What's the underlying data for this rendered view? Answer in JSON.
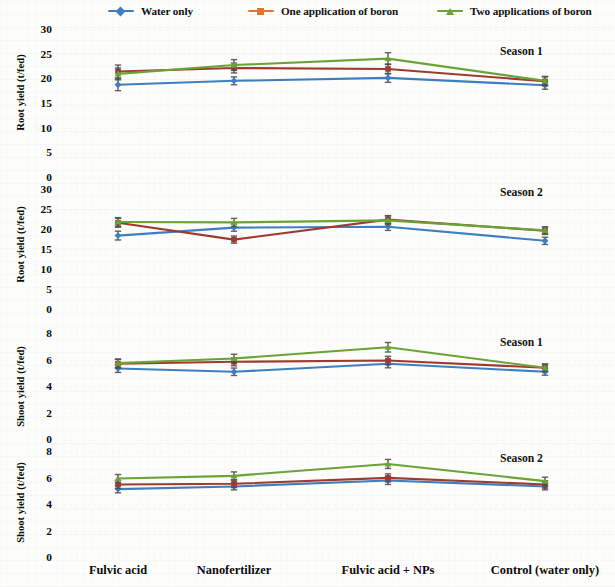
{
  "legend": {
    "items": [
      {
        "label": "Water only",
        "color": "#3d7fc1",
        "marker": "diamond"
      },
      {
        "label": "One application of boron",
        "color": "#e2762c",
        "marker": "square"
      },
      {
        "label": "Two applications of boron",
        "color": "#6aa338",
        "marker": "triangle"
      }
    ]
  },
  "chart_data": {
    "type": "line",
    "title": "",
    "xlabel": "",
    "grid": false,
    "legend_position": "top",
    "categories": [
      "Fulvic acid",
      "Nanofertilizer",
      "Fulvic acid + NPs",
      "Control (water only)"
    ],
    "panels": [
      {
        "id": "root-yield-season-1",
        "season": "Season 1",
        "ylabel": "Root yield (t/fed)",
        "yticks": [
          30,
          25,
          20,
          15,
          10,
          5,
          0
        ],
        "ylim": [
          0,
          30
        ],
        "series": [
          {
            "name": "Water only",
            "color": "#3d7fc1",
            "marker": "diamond",
            "values": [
              18.9,
              19.7,
              20.3,
              18.8
            ],
            "errors": [
              1.2,
              0.8,
              0.9,
              0.8
            ]
          },
          {
            "name": "One application of boron",
            "color": "#a03a2e",
            "marker": "square",
            "values": [
              21.6,
              22.3,
              22.1,
              19.6
            ],
            "errors": [
              1.3,
              1.0,
              1.0,
              0.9
            ]
          },
          {
            "name": "Two applications of boron",
            "color": "#6aa338",
            "marker": "triangle",
            "values": [
              21.1,
              22.9,
              24.2,
              19.7
            ],
            "errors": [
              1.2,
              1.1,
              1.2,
              0.9
            ]
          }
        ]
      },
      {
        "id": "root-yield-season-2",
        "season": "Season 2",
        "ylabel": "Root yield (t/fed)",
        "yticks": [
          30,
          25,
          20,
          15,
          10,
          5,
          0
        ],
        "ylim": [
          0,
          30
        ],
        "series": [
          {
            "name": "Water only",
            "color": "#3d7fc1",
            "marker": "diamond",
            "values": [
              18.6,
              20.6,
              20.8,
              17.3
            ],
            "errors": [
              1.1,
              0.9,
              0.9,
              0.9
            ]
          },
          {
            "name": "One application of boron",
            "color": "#a03a2e",
            "marker": "square",
            "values": [
              21.8,
              17.6,
              22.6,
              19.8
            ],
            "errors": [
              1.1,
              0.9,
              1.0,
              0.9
            ]
          },
          {
            "name": "Two applications of boron",
            "color": "#6aa338",
            "marker": "triangle",
            "values": [
              22.0,
              21.9,
              22.4,
              19.9
            ],
            "errors": [
              1.1,
              1.0,
              1.1,
              0.9
            ]
          }
        ]
      },
      {
        "id": "shoot-yield-season-1",
        "season": "Season 1",
        "ylabel": "Shoot yield (t/fed)",
        "yticks": [
          8,
          6,
          4,
          2,
          0
        ],
        "ylim": [
          0,
          8
        ],
        "series": [
          {
            "name": "Water only",
            "color": "#3d7fc1",
            "marker": "diamond",
            "values": [
              5.4,
              5.15,
              5.75,
              5.15
            ],
            "errors": [
              0.3,
              0.28,
              0.3,
              0.26
            ]
          },
          {
            "name": "One application of boron",
            "color": "#a03a2e",
            "marker": "square",
            "values": [
              5.75,
              5.9,
              6.0,
              5.45
            ],
            "errors": [
              0.32,
              0.3,
              0.32,
              0.28
            ]
          },
          {
            "name": "Two applications of boron",
            "color": "#6aa338",
            "marker": "triangle",
            "values": [
              5.8,
              6.15,
              7.0,
              5.45
            ],
            "errors": [
              0.32,
              0.32,
              0.36,
              0.28
            ]
          }
        ]
      },
      {
        "id": "shoot-yield-season-2",
        "season": "Season 2",
        "ylabel": "Shoot yield (t/fed)",
        "yticks": [
          8,
          6,
          4,
          2,
          0
        ],
        "ylim": [
          0,
          8
        ],
        "series": [
          {
            "name": "Water only",
            "color": "#3d7fc1",
            "marker": "diamond",
            "values": [
              5.2,
              5.4,
              5.85,
              5.4
            ],
            "errors": [
              0.28,
              0.26,
              0.3,
              0.26
            ]
          },
          {
            "name": "One application of boron",
            "color": "#a03a2e",
            "marker": "square",
            "values": [
              5.55,
              5.6,
              6.05,
              5.55
            ],
            "errors": [
              0.3,
              0.28,
              0.3,
              0.28
            ]
          },
          {
            "name": "Two applications of boron",
            "color": "#6aa338",
            "marker": "triangle",
            "values": [
              6.0,
              6.2,
              7.1,
              5.8
            ],
            "errors": [
              0.3,
              0.3,
              0.34,
              0.3
            ]
          }
        ]
      }
    ]
  }
}
